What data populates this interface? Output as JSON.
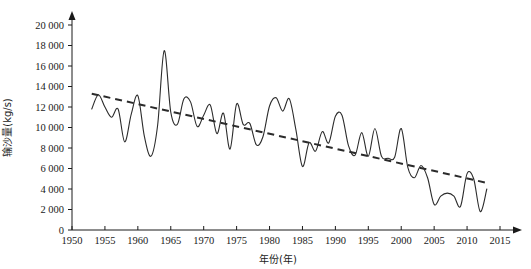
{
  "chart_data": {
    "type": "line",
    "title": "",
    "subtitle": "",
    "xlabel": "年份(年)",
    "ylabel": "输沙量(kg/s)",
    "xlim": [
      1950,
      2015
    ],
    "ylim": [
      0,
      20000
    ],
    "grid": false,
    "legend_position": "none",
    "x_ticks": [
      1950,
      1955,
      1960,
      1965,
      1970,
      1975,
      1980,
      1985,
      1990,
      1995,
      2000,
      2005,
      2010,
      2015
    ],
    "x_tick_labels": [
      "1950",
      "1955",
      "1960",
      "1965",
      "1970",
      "1975",
      "1980",
      "1985",
      "1990",
      "1995",
      "2000",
      "2005",
      "2010",
      "2015"
    ],
    "y_ticks": [
      0,
      2000,
      4000,
      6000,
      8000,
      10000,
      12000,
      14000,
      16000,
      18000,
      20000
    ],
    "y_tick_labels": [
      "0",
      "2 000",
      "4 000",
      "6 000",
      "8 000",
      "10 000",
      "12 000",
      "14 000",
      "16 000",
      "18 000",
      "20 000"
    ],
    "series": [
      {
        "name": "输沙量",
        "style": "solid",
        "color": "#2b2b2b",
        "x": [
          1953,
          1954,
          1955,
          1956,
          1957,
          1958,
          1959,
          1960,
          1961,
          1962,
          1963,
          1964,
          1965,
          1966,
          1967,
          1968,
          1969,
          1970,
          1971,
          1972,
          1973,
          1974,
          1975,
          1976,
          1977,
          1978,
          1979,
          1980,
          1981,
          1982,
          1983,
          1984,
          1985,
          1986,
          1987,
          1988,
          1989,
          1990,
          1991,
          1992,
          1993,
          1994,
          1995,
          1996,
          1997,
          1998,
          1999,
          2000,
          2001,
          2002,
          2003,
          2004,
          2005,
          2006,
          2007,
          2008,
          2009,
          2010,
          2011,
          2012,
          2013
        ],
        "values": [
          11800,
          13200,
          12000,
          11000,
          11800,
          8600,
          11300,
          13100,
          9100,
          7200,
          10200,
          17500,
          11500,
          10300,
          12800,
          12500,
          10100,
          11200,
          12200,
          9400,
          11400,
          7900,
          12300,
          10300,
          10400,
          8300,
          9100,
          12100,
          12900,
          11600,
          12800,
          9800,
          6200,
          8500,
          7700,
          9600,
          8500,
          11100,
          11200,
          8200,
          7300,
          9500,
          7200,
          9900,
          7200,
          7000,
          7100,
          9900,
          6100,
          5100,
          6300,
          5100,
          2500,
          3300,
          3600,
          3300,
          2300,
          5500,
          5000,
          1800,
          4000
        ]
      },
      {
        "name": "趋势线",
        "style": "dashed",
        "color": "#2b2b2b",
        "x": [
          1953,
          2013
        ],
        "values": [
          13300,
          4600
        ]
      }
    ]
  }
}
